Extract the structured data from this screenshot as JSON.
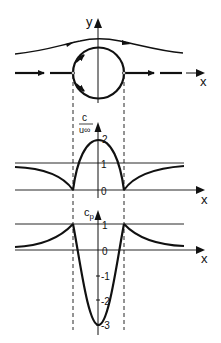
{
  "diagram": {
    "colors": {
      "line": "#111111",
      "background": "#ffffff"
    },
    "top_panel": {
      "x_label": "x",
      "y_label": "y"
    },
    "middle_panel": {
      "y_label_num": "c",
      "y_label_den": "u∞",
      "x_label": "x",
      "ticks": [
        "2",
        "1",
        "0"
      ]
    },
    "bottom_panel": {
      "y_label": "c",
      "y_label_sub": "p",
      "x_label": "x",
      "ticks": [
        "1",
        "0",
        "-1",
        "-2",
        "-3"
      ]
    }
  }
}
